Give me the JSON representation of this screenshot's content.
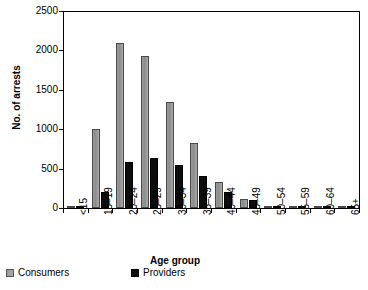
{
  "chart_data": {
    "type": "bar",
    "title": "",
    "xlabel": "Age group",
    "ylabel": "No. of arrests",
    "categories": [
      "<15",
      "15–19",
      "20–24",
      "25–29",
      "30–34",
      "35–39",
      "40–44",
      "45–49",
      "50–54",
      "55–59",
      "60–64",
      "65+"
    ],
    "series": [
      {
        "name": "Consumers",
        "color": "#9a9a9a",
        "values": [
          20,
          1000,
          2100,
          1930,
          1350,
          820,
          335,
          120,
          25,
          8,
          4,
          3
        ]
      },
      {
        "name": "Providers",
        "color": "#0d0d0d",
        "values": [
          5,
          200,
          580,
          630,
          540,
          405,
          205,
          105,
          20,
          6,
          3,
          2
        ]
      }
    ],
    "ylim": [
      0,
      2500
    ],
    "yticks": [
      0,
      500,
      1000,
      1500,
      2000,
      2500
    ],
    "ytick_labels": [
      "0",
      "500",
      "1000",
      "1500",
      "2000",
      "2500"
    ],
    "grid": false,
    "legend_position": "below-left",
    "legend_entries": [
      "Consumers",
      "Providers"
    ]
  }
}
